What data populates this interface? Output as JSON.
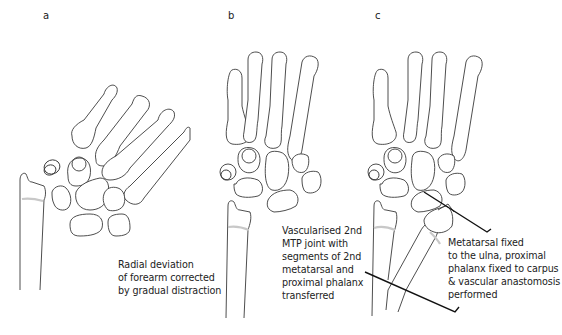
{
  "panels": [
    {
      "label": "a",
      "caption": "Radial deviation\nof forearm corrected\nby gradual distraction"
    },
    {
      "label": "b",
      "caption": "Vascularised 2nd\nMTP joint with\nsegments of 2nd\nmetatarsal and\nproximal phalanx\ntransferred"
    },
    {
      "label": "c",
      "caption": "Metatarsal fixed\nto the ulna, proximal\nphalanx fixed to carpus\n& vascular anastomosis\nperformed"
    }
  ]
}
